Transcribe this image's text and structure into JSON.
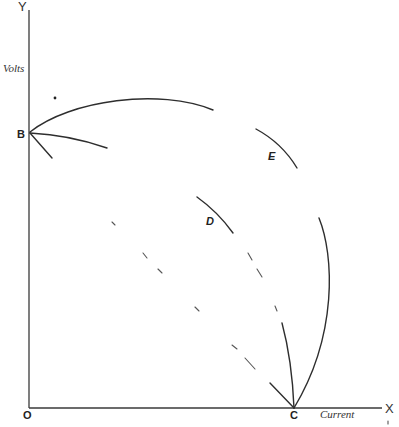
{
  "figure": {
    "axes": {
      "y_letter": "Y",
      "x_letter": "X",
      "y_name": "Volts",
      "x_name": "Current",
      "origin": "O"
    },
    "points": {
      "b": "B",
      "c": "C"
    },
    "curve_labels": {
      "d": "D",
      "e": "E"
    },
    "colors": {
      "ink": "#2e2e2e",
      "background": "#ffffff"
    }
  }
}
